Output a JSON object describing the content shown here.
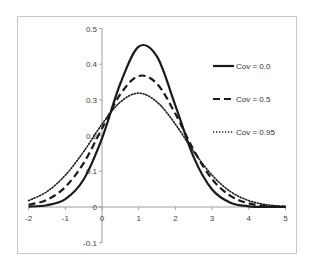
{
  "chart_data": {
    "type": "line",
    "title": "",
    "xlabel": "",
    "ylabel": "",
    "xlim": [
      -2,
      5
    ],
    "ylim": [
      -0.1,
      0.5
    ],
    "grid": false,
    "legend_position": "upper right (inside plot)",
    "x_ticks": [
      "-2",
      "-1",
      "0",
      "1",
      "2",
      "3",
      "4",
      "5"
    ],
    "y_ticks": [
      "-0.1",
      "0",
      "0.1",
      "0.2",
      "0.3",
      "0.4",
      "0.5"
    ],
    "x": [
      -2,
      -1.5,
      -1,
      -0.5,
      0,
      0.5,
      1,
      1.5,
      2,
      2.5,
      3,
      3.5,
      4,
      4.5,
      5
    ],
    "series": [
      {
        "name": "Cov = 0.0",
        "style": "solid",
        "values": [
          0.001,
          0.005,
          0.022,
          0.077,
          0.192,
          0.346,
          0.449,
          0.421,
          0.284,
          0.139,
          0.049,
          0.012,
          0.002,
          0.0003,
          0.0
        ]
      },
      {
        "name": "Cov = 0.5",
        "style": "dashed",
        "values": [
          0.006,
          0.02,
          0.056,
          0.123,
          0.22,
          0.316,
          0.367,
          0.345,
          0.261,
          0.159,
          0.078,
          0.031,
          0.01,
          0.003,
          0.0005
        ]
      },
      {
        "name": "Cov = 0.95",
        "style": "dotted",
        "values": [
          0.018,
          0.043,
          0.089,
          0.155,
          0.232,
          0.294,
          0.319,
          0.294,
          0.232,
          0.155,
          0.089,
          0.043,
          0.018,
          0.006,
          0.002
        ]
      }
    ]
  },
  "colors": {
    "line": "#1a1a1a",
    "axis": "#a0a0a0",
    "frame": "#c8c8c8",
    "text": "#444444"
  }
}
